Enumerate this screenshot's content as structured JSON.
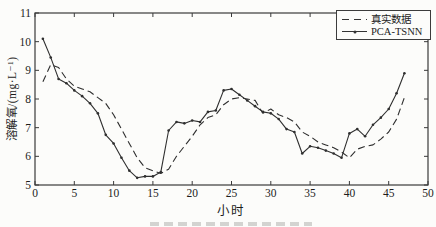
{
  "colors": {
    "line": "#2f2f2f",
    "axis": "#3a3a3a",
    "text": "#1c1c1c",
    "background": "#fcfcfa"
  },
  "chart_data": {
    "type": "line",
    "title": "",
    "xlabel": "小时",
    "ylabel": "溶解氧/(mg·L⁻¹)",
    "xlim": [
      0,
      50
    ],
    "ylim": [
      5,
      11
    ],
    "xticks": [
      0,
      5,
      10,
      15,
      20,
      25,
      30,
      35,
      40,
      45,
      50
    ],
    "yticks": [
      5,
      6,
      7,
      8,
      9,
      10,
      11
    ],
    "grid": false,
    "legend_position": "top-right",
    "x": [
      1,
      2,
      3,
      4,
      5,
      6,
      7,
      8,
      9,
      10,
      11,
      12,
      13,
      14,
      15,
      16,
      17,
      18,
      19,
      20,
      21,
      22,
      23,
      24,
      25,
      26,
      27,
      28,
      29,
      30,
      31,
      32,
      33,
      34,
      35,
      36,
      37,
      38,
      39,
      40,
      41,
      42,
      43,
      44,
      45,
      46,
      47
    ],
    "series": [
      {
        "name": "真实数据",
        "style": "dashed",
        "values": [
          8.6,
          9.2,
          9.1,
          8.7,
          8.45,
          8.35,
          8.25,
          8.05,
          7.85,
          7.45,
          6.95,
          6.45,
          5.95,
          5.6,
          5.5,
          5.4,
          5.55,
          6.0,
          6.35,
          6.7,
          7.1,
          7.35,
          7.45,
          7.8,
          8.0,
          8.05,
          8.0,
          7.95,
          7.5,
          7.65,
          7.45,
          7.35,
          7.2,
          6.85,
          6.7,
          6.5,
          6.4,
          6.3,
          6.15,
          5.95,
          6.25,
          6.35,
          6.4,
          6.6,
          6.85,
          7.3,
          8.05
        ]
      },
      {
        "name": "PCA-TSNN",
        "style": "solid-dot",
        "values": [
          10.1,
          9.45,
          8.7,
          8.55,
          8.3,
          8.1,
          7.85,
          7.5,
          6.75,
          6.45,
          5.95,
          5.5,
          5.25,
          5.3,
          5.3,
          5.45,
          6.9,
          7.2,
          7.15,
          7.25,
          7.2,
          7.55,
          7.6,
          8.3,
          8.35,
          8.15,
          7.95,
          7.75,
          7.55,
          7.5,
          7.3,
          6.95,
          6.85,
          6.1,
          6.35,
          6.3,
          6.2,
          6.1,
          5.95,
          6.8,
          6.95,
          6.7,
          7.1,
          7.35,
          7.65,
          8.2,
          8.9
        ]
      }
    ]
  }
}
